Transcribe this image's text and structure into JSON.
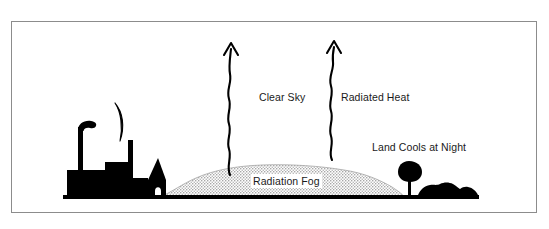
{
  "figure": {
    "type": "radiation-fog-formation-diagram",
    "frame": {
      "border_color": "#8c8c8c",
      "background_color": "#ffffff"
    },
    "labels": {
      "clear_sky": "Clear Sky",
      "radiated_heat": "Radiated Heat",
      "land_cools_at_night": "Land Cools at Night",
      "radiation_fog": "Radiation Fog"
    },
    "colors": {
      "ink": "#000000",
      "text": "#1a1a1a",
      "fog_fill": "#c8c8c8",
      "fog_edge": "#9a9a9a",
      "frame": "#8c8c8c",
      "background": "#ffffff"
    },
    "elements": {
      "moon": "crescent-moon-outline",
      "factory": "factory-silhouette-with-smokestack",
      "chimney": "tall-chimney-silhouette",
      "church": "pointed-roof-building-silhouette",
      "tree": "tree-silhouette",
      "bushes": "bush-and-hill-silhouette",
      "ground": "ground-line",
      "fog_bank": "stippled-fog-bank",
      "arrow_left": "wavy-upward-arrow",
      "arrow_right": "wavy-upward-arrow"
    }
  }
}
